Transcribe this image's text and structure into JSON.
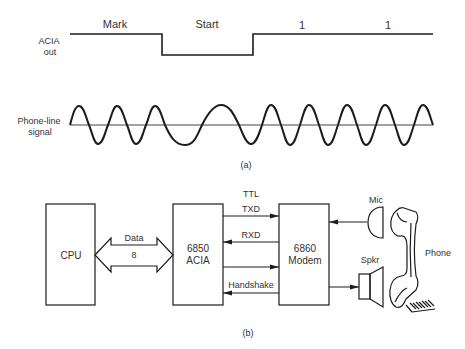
{
  "part_a": {
    "caption": "(a)",
    "acia_out": {
      "label_line1": "ACIA",
      "label_line2": "out",
      "segments": [
        "Mark",
        "Start",
        "1",
        "1"
      ]
    },
    "phone_line": {
      "label_line1": "Phone-line",
      "label_line2": "signal"
    }
  },
  "part_b": {
    "caption": "(b)",
    "cpu": {
      "label": "CPU"
    },
    "data_bus": {
      "label": "Data",
      "width": "8"
    },
    "acia": {
      "line1": "6850",
      "line2": "ACIA"
    },
    "modem": {
      "line1": "6860",
      "line2": "Modem"
    },
    "signals": {
      "ttl": "TTL",
      "txd": "TXD",
      "rxd": "RXD",
      "handshake": "Handshake"
    },
    "mic": {
      "label": "Mic"
    },
    "speaker": {
      "label": "Spkr"
    },
    "phone": {
      "label": "Phone"
    }
  },
  "colors": {
    "line": "#1c1c1c",
    "text": "#333333",
    "background": "#ffffff"
  }
}
